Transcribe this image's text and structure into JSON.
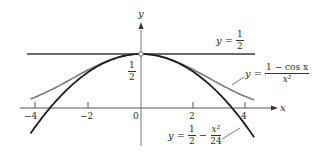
{
  "chart_data": {
    "type": "line",
    "title": "",
    "xlabel": "x",
    "ylabel": "y",
    "xlim": [
      -4.3,
      5.0
    ],
    "ylim": [
      -0.35,
      0.78
    ],
    "grid": false,
    "legend": "inline annotations",
    "x_ticks": [
      -4,
      -2,
      0,
      2,
      4
    ],
    "x_tick_labels": [
      "-4",
      "-2",
      "0",
      "2",
      "4"
    ],
    "y_tick_labels": [
      "1/2"
    ],
    "series": [
      {
        "name": "y = 1/2",
        "expr": "0.5",
        "color": "#3a3a3a",
        "x_range": [
          -4.2,
          4.2
        ]
      },
      {
        "name": "y = (1 - cos x)/x^2",
        "expr": "(1-cos x)/x^2",
        "color": "#7a7a7a",
        "x_range": [
          -4.2,
          4.3
        ]
      },
      {
        "name": "y = 1/2 - x^2/24",
        "expr": "0.5 - x^2/24",
        "color": "#1e1e1e",
        "x_range": [
          -4.2,
          4.3
        ]
      }
    ],
    "points": [
      {
        "x": 0,
        "y": 0.5,
        "style": "open-circle"
      }
    ]
  },
  "labels": {
    "y_axis": "y",
    "x_axis": "x",
    "tick_m4": "−4",
    "tick_m2": "−2",
    "tick_0": "0",
    "tick_2": "2",
    "tick_4": "4",
    "half_num": "1",
    "half_den": "2",
    "line_y": "y",
    "line_eq": "=",
    "line_num": "1",
    "line_den": "2",
    "cos_y": "y",
    "cos_eq": "=",
    "cos_num": "1 − cos x",
    "cos_den": "x²",
    "poly_y": "y",
    "poly_eq": "=",
    "poly_num1": "1",
    "poly_den1": "2",
    "poly_minus": "−",
    "poly_num2": "x²",
    "poly_den2": "24"
  }
}
